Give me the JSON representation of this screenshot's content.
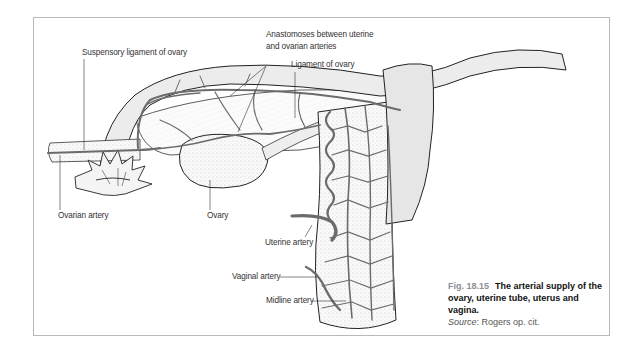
{
  "figure": {
    "number": "Fig. 18.15",
    "title": "The arterial supply of the ovary, uterine tube, uterus and vagina.",
    "source_label": "Source",
    "source_text": ": Rogers op. cit."
  },
  "labels": {
    "suspensory_ligament": "Suspensory ligament of ovary",
    "anastomoses_line1": "Anastomoses between uterine",
    "anastomoses_line2": "and ovarian arteries",
    "ligament_of_ovary": "Ligament of ovary",
    "ovarian_artery": "Ovarian artery",
    "ovary": "Ovary",
    "uterine_artery": "Uterine artery",
    "vaginal_artery": "Vaginal artery",
    "midline_artery": "Midline artery"
  },
  "colors": {
    "artery": "#6b6b6b",
    "tissue": "#f2f2f2",
    "outline": "#2a2a2a",
    "frame": "#b8b8b8",
    "figure_number": "#8a8f98"
  }
}
